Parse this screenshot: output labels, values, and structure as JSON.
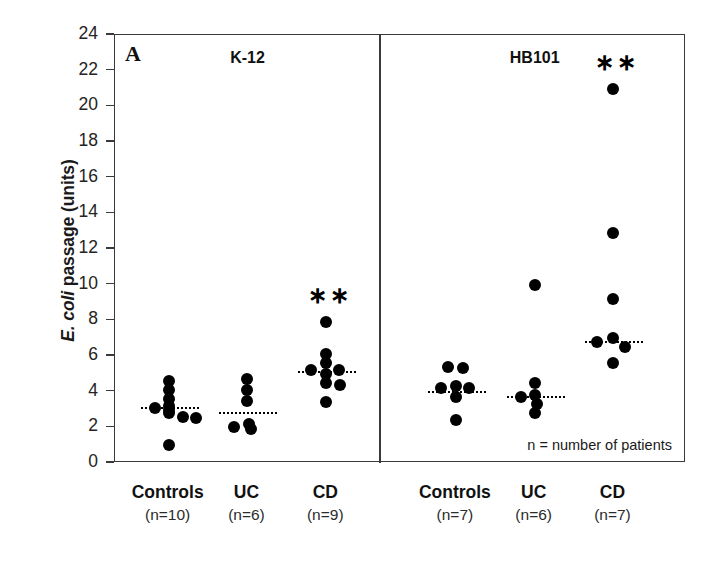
{
  "figure": {
    "panel_label": "A",
    "footnote": "n = number of patients",
    "axis_color": "#3a3a3a",
    "dot_color": "#000000"
  },
  "chart_data": {
    "type": "scatter",
    "title": "",
    "xlabel": "",
    "ylabel": "E. coli passage (units)",
    "ylabel_italic_part": "E. coli",
    "ylabel_rest": " passage (units)",
    "ylim": [
      0,
      24
    ],
    "yticks": [
      0,
      2,
      4,
      6,
      8,
      10,
      12,
      14,
      16,
      18,
      20,
      22,
      24
    ],
    "grid": false,
    "legend": "none",
    "panels": [
      {
        "name": "K-12",
        "groups": [
          {
            "label": "Controls",
            "n_label": "(n=10)",
            "n": 10,
            "median": 3.1,
            "significance": "",
            "values": [
              4.6,
              4.1,
              3.6,
              3.2,
              3.1,
              3.0,
              2.8,
              2.5,
              2.4,
              1.0
            ],
            "points": [
              {
                "v": 4.6,
                "dx": 0
              },
              {
                "v": 4.1,
                "dx": 0
              },
              {
                "v": 3.6,
                "dx": 0
              },
              {
                "v": 3.2,
                "dx": 0
              },
              {
                "v": 3.1,
                "dx": -14
              },
              {
                "v": 3.0,
                "dx": 0
              },
              {
                "v": 2.8,
                "dx": 0
              },
              {
                "v": 2.6,
                "dx": 14
              },
              {
                "v": 2.5,
                "dx": 27
              },
              {
                "v": 1.0,
                "dx": 0
              }
            ]
          },
          {
            "label": "UC",
            "n_label": "(n=6)",
            "n": 6,
            "median": 2.8,
            "significance": "",
            "values": [
              4.7,
              4.1,
              3.5,
              2.2,
              2.0,
              1.9
            ],
            "points": [
              {
                "v": 4.7,
                "dx": 0
              },
              {
                "v": 4.1,
                "dx": 0
              },
              {
                "v": 3.5,
                "dx": 0
              },
              {
                "v": 2.2,
                "dx": 2
              },
              {
                "v": 2.0,
                "dx": -13
              },
              {
                "v": 1.9,
                "dx": 4
              }
            ]
          },
          {
            "label": "CD",
            "n_label": "(n=9)",
            "n": 9,
            "median": 5.1,
            "significance": "∗∗",
            "values": [
              7.9,
              6.1,
              5.6,
              5.2,
              5.1,
              5.0,
              4.7,
              4.4,
              3.4
            ],
            "points": [
              {
                "v": 7.9,
                "dx": 0
              },
              {
                "v": 6.1,
                "dx": 0
              },
              {
                "v": 5.6,
                "dx": 0
              },
              {
                "v": 5.2,
                "dx": -15
              },
              {
                "v": 5.2,
                "dx": 13
              },
              {
                "v": 5.0,
                "dx": 0
              },
              {
                "v": 4.5,
                "dx": 0
              },
              {
                "v": 4.4,
                "dx": 14
              },
              {
                "v": 3.4,
                "dx": 0
              }
            ]
          }
        ]
      },
      {
        "name": "HB101",
        "groups": [
          {
            "label": "Controls",
            "n_label": "(n=7)",
            "n": 7,
            "median": 4.0,
            "significance": "",
            "values": [
              5.4,
              5.3,
              4.3,
              4.1,
              4.0,
              3.6,
              2.4
            ],
            "points": [
              {
                "v": 5.4,
                "dx": -8
              },
              {
                "v": 5.3,
                "dx": 7
              },
              {
                "v": 4.3,
                "dx": 0
              },
              {
                "v": 4.2,
                "dx": -15
              },
              {
                "v": 4.2,
                "dx": 13
              },
              {
                "v": 3.7,
                "dx": 0
              },
              {
                "v": 2.4,
                "dx": 0
              }
            ]
          },
          {
            "label": "UC",
            "n_label": "(n=6)",
            "n": 6,
            "median": 3.7,
            "significance": "",
            "values": [
              10.0,
              4.5,
              3.9,
              3.7,
              3.4,
              2.8
            ],
            "points": [
              {
                "v": 10.0,
                "dx": 0
              },
              {
                "v": 4.5,
                "dx": 0
              },
              {
                "v": 3.8,
                "dx": 0
              },
              {
                "v": 3.7,
                "dx": -14
              },
              {
                "v": 3.3,
                "dx": 2
              },
              {
                "v": 2.8,
                "dx": 0
              }
            ]
          },
          {
            "label": "CD",
            "n_label": "(n=7)",
            "n": 7,
            "median": 6.8,
            "significance": "∗∗",
            "values": [
              21.0,
              12.9,
              9.2,
              7.0,
              6.8,
              6.5,
              5.6
            ],
            "points": [
              {
                "v": 21.0,
                "dx": 0
              },
              {
                "v": 12.9,
                "dx": 0
              },
              {
                "v": 9.2,
                "dx": 0
              },
              {
                "v": 7.0,
                "dx": 0
              },
              {
                "v": 6.8,
                "dx": -16
              },
              {
                "v": 6.5,
                "dx": 12
              },
              {
                "v": 5.6,
                "dx": 0
              }
            ]
          }
        ]
      }
    ]
  }
}
